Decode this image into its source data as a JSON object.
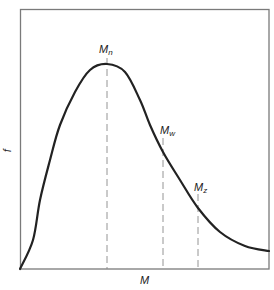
{
  "chart_data": {
    "type": "line",
    "title": "",
    "xlabel": "M",
    "ylabel": "f",
    "grid": false,
    "legend": null,
    "axis_ticks": false,
    "series": [
      {
        "name": "molecular weight distribution",
        "points_px": [
          [
            20,
            269
          ],
          [
            33,
            240
          ],
          [
            40,
            200
          ],
          [
            50,
            160
          ],
          [
            60,
            125
          ],
          [
            75,
            92
          ],
          [
            90,
            70
          ],
          [
            107,
            64
          ],
          [
            125,
            72
          ],
          [
            140,
            100
          ],
          [
            150,
            125
          ],
          [
            163,
            152
          ],
          [
            180,
            180
          ],
          [
            198,
            208
          ],
          [
            220,
            232
          ],
          [
            245,
            246
          ],
          [
            269,
            251
          ]
        ]
      }
    ],
    "annotations": [
      {
        "label": "M",
        "sub": "n",
        "x_px": 107,
        "description": "number-average molecular weight (at peak)"
      },
      {
        "label": "M",
        "sub": "w",
        "x_px": 163,
        "description": "weight-average molecular weight"
      },
      {
        "label": "M",
        "sub": "z",
        "x_px": 198,
        "description": "z-average molecular weight"
      }
    ]
  },
  "labels": {
    "x_axis": "M",
    "y_axis": "f",
    "mn_main": "M",
    "mn_sub": "n",
    "mw_main": "M",
    "mw_sub": "w",
    "mz_main": "M",
    "mz_sub": "z"
  }
}
